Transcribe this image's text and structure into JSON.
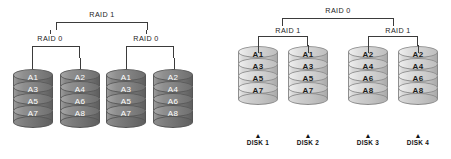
{
  "diagram": {
    "background_color": "#ffffff",
    "line_color": "#3b3b3b"
  },
  "panels": [
    {
      "id": "raid-01",
      "top_label": "RAID 1",
      "group_labels": [
        "RAID 0",
        "RAID 0"
      ],
      "disk_style": "dark",
      "disk_fill": "#7b7b7b",
      "disk_text_color": "#ffffff",
      "disks": [
        {
          "name": "disk-1",
          "blocks": [
            "A1",
            "A3",
            "A5",
            "A7"
          ]
        },
        {
          "name": "disk-2",
          "blocks": [
            "A2",
            "A4",
            "A6",
            "A8"
          ]
        },
        {
          "name": "disk-3",
          "blocks": [
            "A1",
            "A3",
            "A5",
            "A7"
          ]
        },
        {
          "name": "disk-4",
          "blocks": [
            "A2",
            "A4",
            "A6",
            "A8"
          ]
        }
      ]
    },
    {
      "id": "raid-10",
      "top_label": "RAID 0",
      "group_labels": [
        "RAID 1",
        "RAID 1"
      ],
      "disk_style": "light",
      "disk_fill": "#cfcfcf",
      "disk_text_color": "#1b1b1b",
      "disks": [
        {
          "name": "disk-1",
          "caption": "DISK 1",
          "caret": "▲",
          "blocks": [
            "A1",
            "A3",
            "A5",
            "A7"
          ]
        },
        {
          "name": "disk-2",
          "caption": "DISK 2",
          "caret": "▲",
          "blocks": [
            "A1",
            "A3",
            "A5",
            "A7"
          ]
        },
        {
          "name": "disk-3",
          "caption": "DISK 3",
          "caret": "▲",
          "blocks": [
            "A2",
            "A4",
            "A6",
            "A8"
          ]
        },
        {
          "name": "disk-4",
          "caption": "DISK 4",
          "caret": "▲",
          "blocks": [
            "A2",
            "A4",
            "A6",
            "A8"
          ]
        }
      ]
    }
  ]
}
